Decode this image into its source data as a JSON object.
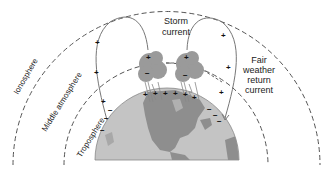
{
  "diagram": {
    "layers": [
      {
        "name": "Ionosphere",
        "label": "Ionosphere"
      },
      {
        "name": "Middle atmosphere",
        "label": "Middle atmosphere"
      },
      {
        "name": "Troposphere",
        "label": "Troposphere"
      }
    ],
    "labels": {
      "storm_current_line1": "Storm",
      "storm_current_line2": "current",
      "fair_line1": "Fair",
      "fair_line2": "weather",
      "fair_line3": "return",
      "fair_line4": "current"
    },
    "signs": {
      "plus": "+",
      "minus": "−"
    },
    "colors": {
      "background": "#ffffff",
      "dashed_lines": "#555555",
      "current_lines": "#777777",
      "earth_ocean": "#c4c4c4",
      "earth_land": "#8e8e8e",
      "cloud": "#9a9a9a",
      "text": "#222222"
    }
  }
}
